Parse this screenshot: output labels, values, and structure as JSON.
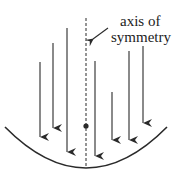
{
  "diagram": {
    "label": {
      "line1": "axis of",
      "line2": "symmetry"
    },
    "colors": {
      "stroke": "#2a2a2a",
      "background": "#ffffff"
    },
    "elements": {
      "axis": {
        "type": "dashed-line",
        "name": "axis of symmetry"
      },
      "focus": {
        "type": "dot",
        "name": "focus point"
      },
      "mirror": {
        "type": "parabola",
        "name": "parabolic mirror"
      },
      "rays": {
        "count": 7,
        "direction": "down",
        "name": "incoming parallel rays"
      }
    }
  }
}
